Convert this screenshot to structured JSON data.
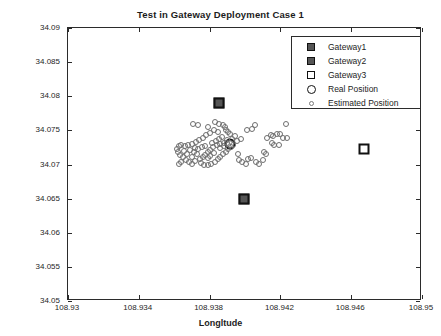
{
  "chart_data": {
    "type": "scatter",
    "title": "Test in Gateway Deployment Case 1",
    "xlabel": "Longltude",
    "ylabel": "Latitude",
    "xlim": [
      108.93,
      108.95
    ],
    "ylim": [
      34.05,
      34.09
    ],
    "xticks": [
      "108.93",
      "108.934",
      "108.938",
      "108.942",
      "108.946",
      "108.95"
    ],
    "xtick_values": [
      108.93,
      108.934,
      108.938,
      108.942,
      108.946,
      108.95
    ],
    "yticks": [
      "34.05",
      "34.055",
      "34.06",
      "34.065",
      "34.07",
      "34.075",
      "34.08",
      "34.085",
      "34.09"
    ],
    "ytick_values": [
      34.05,
      34.055,
      34.06,
      34.065,
      34.07,
      34.075,
      34.08,
      34.085,
      34.09
    ],
    "grid": false,
    "legend_position": "top-right",
    "series": [
      {
        "name": "Gateway1",
        "marker": "filled-square",
        "color": "#555555",
        "points": [
          [
            108.93855,
            34.079
          ]
        ]
      },
      {
        "name": "Gateway2",
        "marker": "filled-square",
        "color": "#555555",
        "points": [
          [
            108.93995,
            34.065
          ]
        ]
      },
      {
        "name": "Gateway3",
        "marker": "open-square",
        "color": "#ffffff",
        "points": [
          [
            108.9467,
            34.0722
          ]
        ]
      },
      {
        "name": "Real Position",
        "marker": "bold-circle",
        "color": "#111111",
        "points": [
          [
            108.93915,
            34.073
          ]
        ]
      },
      {
        "name": "Estimated Position",
        "marker": "small-circle",
        "color": "#6e6e6e",
        "points": [
          [
            108.93705,
            34.07595
          ],
          [
            108.93735,
            34.07585
          ],
          [
            108.9379,
            34.07555
          ],
          [
            108.9383,
            34.0762
          ],
          [
            108.93855,
            34.076
          ],
          [
            108.93875,
            34.0758
          ],
          [
            108.93885,
            34.07545
          ],
          [
            108.9389,
            34.07505
          ],
          [
            108.93905,
            34.0748
          ],
          [
            108.93915,
            34.0744
          ],
          [
            108.93845,
            34.0747
          ],
          [
            108.93825,
            34.07505
          ],
          [
            108.938,
            34.0746
          ],
          [
            108.9378,
            34.0743
          ],
          [
            108.9376,
            34.07395
          ],
          [
            108.9374,
            34.0736
          ],
          [
            108.93725,
            34.0733
          ],
          [
            108.937,
            34.073
          ],
          [
            108.9368,
            34.0728
          ],
          [
            108.9366,
            34.0727
          ],
          [
            108.9364,
            34.0729
          ],
          [
            108.93625,
            34.0727
          ],
          [
            108.93615,
            34.0723
          ],
          [
            108.9362,
            34.0718
          ],
          [
            108.9363,
            34.0714
          ],
          [
            108.9365,
            34.07105
          ],
          [
            108.93665,
            34.0707
          ],
          [
            108.9364,
            34.0703
          ],
          [
            108.93625,
            34.0701
          ],
          [
            108.93685,
            34.0704
          ],
          [
            108.937,
            34.0701
          ],
          [
            108.9372,
            34.07055
          ],
          [
            108.93745,
            34.0708
          ],
          [
            108.9376,
            34.0711
          ],
          [
            108.93775,
            34.07145
          ],
          [
            108.9379,
            34.0718
          ],
          [
            108.93805,
            34.07215
          ],
          [
            108.9382,
            34.0725
          ],
          [
            108.9384,
            34.07285
          ],
          [
            108.9386,
            34.07305
          ],
          [
            108.9388,
            34.07315
          ],
          [
            108.939,
            34.0731
          ],
          [
            108.9369,
            34.0721
          ],
          [
            108.9371,
            34.0718
          ],
          [
            108.9373,
            34.07155
          ],
          [
            108.9375,
            34.0702
          ],
          [
            108.9377,
            34.07
          ],
          [
            108.9379,
            34.0699
          ],
          [
            108.9381,
            34.0701
          ],
          [
            108.9383,
            34.0704
          ],
          [
            108.93845,
            34.07075
          ],
          [
            108.9386,
            34.0711
          ],
          [
            108.93875,
            34.0715
          ],
          [
            108.9389,
            34.0719
          ],
          [
            108.93905,
            34.07225
          ],
          [
            108.9392,
            34.0726
          ],
          [
            108.93935,
            34.0729
          ],
          [
            108.9379,
            34.0709
          ],
          [
            108.93805,
            34.0713
          ],
          [
            108.93825,
            34.07165
          ],
          [
            108.9367,
            34.07155
          ],
          [
            108.93655,
            34.072
          ],
          [
            108.937,
            34.0711
          ],
          [
            108.93715,
            34.0724
          ],
          [
            108.93735,
            34.0723
          ],
          [
            108.93755,
            34.07255
          ],
          [
            108.93775,
            34.07275
          ],
          [
            108.9386,
            34.07245
          ],
          [
            108.9388,
            34.0727
          ],
          [
            108.939,
            34.07355
          ],
          [
            108.93925,
            34.0738
          ],
          [
            108.93945,
            34.0742
          ],
          [
            108.9387,
            34.07405
          ],
          [
            108.93855,
            34.0737
          ],
          [
            108.93835,
            34.07345
          ],
          [
            108.93815,
            34.07315
          ],
          [
            108.93955,
            34.07345
          ],
          [
            108.93975,
            34.07375
          ],
          [
            108.9401,
            34.07505
          ],
          [
            108.9404,
            34.0752
          ],
          [
            108.94015,
            34.07075
          ],
          [
            108.94035,
            34.0709
          ],
          [
            108.9406,
            34.0703
          ],
          [
            108.9408,
            34.0701
          ],
          [
            108.941,
            34.0706
          ],
          [
            108.9412,
            34.0715
          ],
          [
            108.94105,
            34.0719
          ],
          [
            108.94125,
            34.07395
          ],
          [
            108.94145,
            34.0743
          ],
          [
            108.9416,
            34.0742
          ],
          [
            108.9418,
            34.07445
          ],
          [
            108.942,
            34.0744
          ],
          [
            108.94215,
            34.07395
          ],
          [
            108.94235,
            34.07395
          ],
          [
            108.9423,
            34.076
          ],
          [
            108.94155,
            34.0732
          ],
          [
            108.94165,
            34.0728
          ],
          [
            108.94055,
            34.0758
          ],
          [
            108.93965,
            34.0707
          ],
          [
            108.93985,
            34.0703
          ],
          [
            108.94005,
            34.0701
          ],
          [
            108.9396,
            34.0715
          ],
          [
            108.9419,
            34.0729
          ]
        ]
      }
    ]
  },
  "legend": {
    "entries": [
      {
        "label": "Gateway1",
        "symbol": "filled-square-icon"
      },
      {
        "label": "Gateway2",
        "symbol": "filled-square-icon"
      },
      {
        "label": "Gateway3",
        "symbol": "open-square-icon"
      },
      {
        "label": "Real Position",
        "symbol": "bold-circle-icon"
      },
      {
        "label": "Estimated Position",
        "symbol": "small-circle-icon"
      }
    ]
  }
}
